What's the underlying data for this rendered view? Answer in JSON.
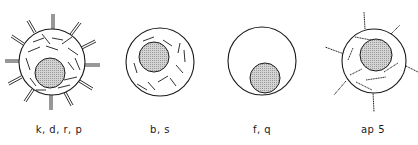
{
  "diagram": {
    "type": "cell-morphology-comparison",
    "colors": {
      "stroke": "#1a1a1a",
      "nucleus_fill": "#c8c8c8",
      "background": "#ffffff"
    },
    "cells": [
      {
        "id": "cell-1",
        "label": "k, d, r, p",
        "features": [
          "many cytoplasmic fibrils",
          "surface projections (many)",
          "nucleus"
        ]
      },
      {
        "id": "cell-2",
        "label": "b, s",
        "features": [
          "cytoplasmic fibrils",
          "nucleus",
          "no projections"
        ]
      },
      {
        "id": "cell-3",
        "label": "f, q",
        "features": [
          "nucleus",
          "no fibrils",
          "no projections"
        ]
      },
      {
        "id": "cell-4",
        "label": "ap 5",
        "features": [
          "cytoplasmic fibrils",
          "surface projections (few)",
          "nucleus"
        ]
      }
    ]
  }
}
